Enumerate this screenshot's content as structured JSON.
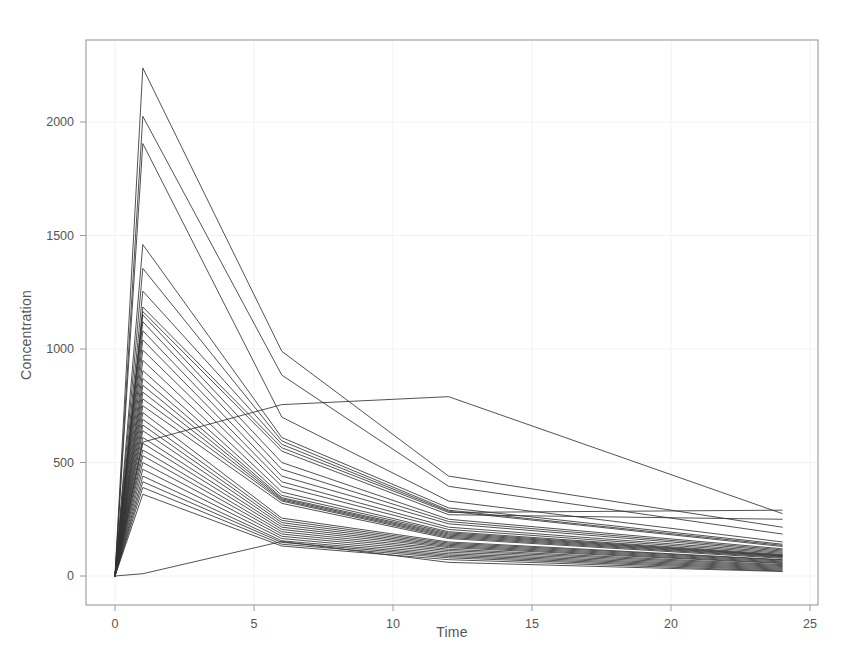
{
  "figure": {
    "background_color": "#ffffff",
    "line_color": "#333333",
    "text_color": "#555555",
    "grid_color": "#f2f2f2",
    "frame_color": "#9a9a9a"
  },
  "axes": {
    "x_title": "Time",
    "y_title": "Concentration",
    "x_ticks": [
      "0",
      "5",
      "10",
      "15",
      "20",
      "25"
    ],
    "y_ticks": [
      "0",
      "500",
      "1000",
      "1500",
      "2000"
    ]
  },
  "chart_data": {
    "type": "line",
    "title": "",
    "subtitle": "",
    "xlabel": "Time",
    "ylabel": "Concentration",
    "xlim": [
      -1.2,
      25.6
    ],
    "ylim": [
      -250,
      2400
    ],
    "xticks": [
      0,
      5,
      10,
      15,
      20,
      25
    ],
    "yticks": [
      0,
      500,
      1000,
      1500,
      2000
    ],
    "grid": true,
    "legend": null,
    "legend_position": "none",
    "annotations": [],
    "x": [
      0,
      1,
      6,
      12,
      24
    ],
    "series": [
      {
        "name": "subject-01",
        "values": [
          0,
          2238,
          990,
          440,
          215
        ]
      },
      {
        "name": "subject-02",
        "values": [
          0,
          2025,
          885,
          395,
          185
        ]
      },
      {
        "name": "subject-03",
        "values": [
          0,
          1905,
          700,
          330,
          150
        ]
      },
      {
        "name": "subject-04",
        "values": [
          0,
          1460,
          610,
          300,
          140
        ]
      },
      {
        "name": "subject-05",
        "values": [
          0,
          1355,
          595,
          290,
          135
        ]
      },
      {
        "name": "subject-06",
        "values": [
          0,
          1255,
          580,
          285,
          130
        ]
      },
      {
        "name": "subject-07",
        "values": [
          0,
          1185,
          565,
          280,
          290
        ]
      },
      {
        "name": "subject-08",
        "values": [
          0,
          1165,
          550,
          270,
          250
        ]
      },
      {
        "name": "subject-09",
        "values": [
          0,
          1150,
          500,
          250,
          120
        ]
      },
      {
        "name": "subject-10",
        "values": [
          0,
          1120,
          470,
          240,
          115
        ]
      },
      {
        "name": "subject-11",
        "values": [
          0,
          1080,
          440,
          230,
          110
        ]
      },
      {
        "name": "subject-12",
        "values": [
          0,
          1040,
          415,
          215,
          105
        ]
      },
      {
        "name": "subject-13",
        "values": [
          0,
          995,
          395,
          205,
          100
        ]
      },
      {
        "name": "subject-14",
        "values": [
          0,
          950,
          370,
          195,
          95
        ]
      },
      {
        "name": "subject-15",
        "values": [
          0,
          905,
          355,
          190,
          92
        ]
      },
      {
        "name": "subject-16",
        "values": [
          0,
          870,
          345,
          185,
          90
        ]
      },
      {
        "name": "subject-17",
        "values": [
          0,
          840,
          340,
          180,
          88
        ]
      },
      {
        "name": "subject-18",
        "values": [
          0,
          810,
          335,
          175,
          85
        ]
      },
      {
        "name": "subject-19",
        "values": [
          0,
          780,
          330,
          170,
          82
        ]
      },
      {
        "name": "subject-20",
        "values": [
          0,
          750,
          320,
          165,
          78
        ]
      },
      {
        "name": "subject-21",
        "values": [
          0,
          720,
          255,
          150,
          72
        ]
      },
      {
        "name": "subject-22",
        "values": [
          0,
          690,
          245,
          145,
          70
        ]
      },
      {
        "name": "subject-23",
        "values": [
          0,
          665,
          235,
          140,
          66
        ]
      },
      {
        "name": "subject-24",
        "values": [
          0,
          640,
          225,
          135,
          62
        ]
      },
      {
        "name": "subject-25",
        "values": [
          0,
          610,
          215,
          130,
          58
        ]
      },
      {
        "name": "subject-26",
        "values": [
          0,
          585,
          205,
          125,
          55
        ]
      },
      {
        "name": "subject-27",
        "values": [
          0,
          555,
          195,
          118,
          50
        ]
      },
      {
        "name": "subject-28",
        "values": [
          0,
          530,
          185,
          112,
          46
        ]
      },
      {
        "name": "subject-29",
        "values": [
          0,
          500,
          175,
          105,
          42
        ]
      },
      {
        "name": "subject-30",
        "values": [
          0,
          470,
          165,
          98,
          38
        ]
      },
      {
        "name": "subject-31",
        "values": [
          0,
          440,
          155,
          92,
          34
        ]
      },
      {
        "name": "subject-32",
        "values": [
          0,
          415,
          148,
          86,
          30
        ]
      },
      {
        "name": "subject-33",
        "values": [
          0,
          390,
          140,
          80,
          26
        ]
      },
      {
        "name": "subject-34",
        "values": [
          0,
          360,
          132,
          72,
          22
        ]
      },
      {
        "name": "subject-35-late-peak",
        "values": [
          0,
          590,
          755,
          790,
          275
        ]
      },
      {
        "name": "subject-36-slow-rise",
        "values": [
          0,
          10,
          152,
          60,
          20
        ]
      }
    ]
  }
}
